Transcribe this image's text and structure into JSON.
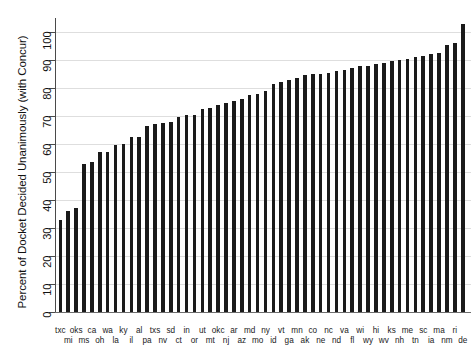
{
  "chart_data": {
    "type": "bar",
    "title": "",
    "subtitle": "",
    "xlabel": "",
    "ylabel": "Percent of Docket Decided Unanimously (with Concur)",
    "ylim": [
      0,
      105
    ],
    "yticks": [
      0,
      10,
      20,
      30,
      40,
      50,
      60,
      70,
      80,
      90,
      100
    ],
    "ytick_labels": [
      "0",
      "10",
      "20",
      "30",
      "40",
      "50",
      "60",
      "70",
      "80",
      "90",
      "100"
    ],
    "grid": true,
    "legend": "none",
    "orientation": "vertical",
    "bar_color": "#1a1a1a",
    "categories": [
      "txc",
      "mi",
      "oks",
      "ms",
      "ca",
      "oh",
      "wa",
      "la",
      "ky",
      "il",
      "al",
      "pa",
      "txs",
      "nv",
      "sd",
      "ct",
      "in",
      "or",
      "ut",
      "mt",
      "okc",
      "nj",
      "ar",
      "az",
      "md",
      "mo",
      "ny",
      "id",
      "vt",
      "ga",
      "mn",
      "ak",
      "co",
      "ne",
      "nc",
      "nd",
      "va",
      "fl",
      "wi",
      "wy",
      "hi",
      "wv",
      "ks",
      "nh",
      "me",
      "tn",
      "sc",
      "ia",
      "ma",
      "nm",
      "ri",
      "de"
    ],
    "values": [
      33.0,
      36.2,
      37.2,
      53.0,
      53.4,
      57.0,
      57.0,
      59.8,
      60.0,
      62.5,
      62.5,
      66.5,
      67.0,
      67.5,
      68.0,
      69.5,
      70.5,
      70.5,
      72.5,
      73.0,
      74.0,
      74.5,
      75.5,
      76.0,
      77.5,
      78.0,
      79.0,
      81.5,
      82.0,
      83.0,
      83.5,
      84.5,
      85.0,
      85.0,
      85.5,
      86.0,
      86.5,
      87.0,
      88.0,
      88.0,
      88.5,
      89.0,
      89.5,
      90.0,
      90.5,
      91.0,
      91.5,
      92.0,
      92.5,
      95.5,
      96.0,
      103.0
    ]
  }
}
